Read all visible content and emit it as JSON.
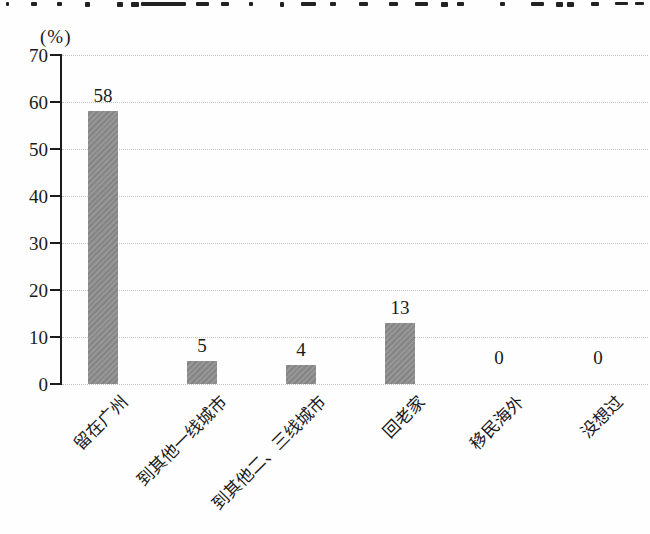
{
  "chart_data": {
    "type": "bar",
    "title": "",
    "ylabel": "(%)",
    "xlabel": "",
    "categories": [
      "留在广州",
      "到其他一线城市",
      "到其他二、三线城市",
      "回老家",
      "移民海外",
      "没想过"
    ],
    "values": [
      58,
      5,
      4,
      13,
      0,
      0
    ],
    "data_labels": [
      "58",
      "5",
      "4",
      "13",
      "0",
      "0"
    ],
    "ylim": [
      0,
      70
    ],
    "yticks": [
      0,
      10,
      20,
      30,
      40,
      50,
      60,
      70
    ],
    "grid": "horizontal-dotted",
    "legend": "none",
    "bar_color": "#8c8c8c",
    "gridline_color": "#c6c6c6",
    "axis_color": "#1b1b1b"
  },
  "top_clipped_marks": [
    {
      "x": 6,
      "w": 3,
      "h": 4
    },
    {
      "x": 31,
      "w": 6,
      "h": 4
    },
    {
      "x": 57,
      "w": 5,
      "h": 4
    },
    {
      "x": 85,
      "w": 5,
      "h": 5
    },
    {
      "x": 117,
      "w": 6,
      "h": 5
    },
    {
      "x": 131,
      "w": 8,
      "h": 5
    },
    {
      "x": 141,
      "w": 45,
      "h": 4
    },
    {
      "x": 196,
      "w": 13,
      "h": 4
    },
    {
      "x": 221,
      "w": 8,
      "h": 4
    },
    {
      "x": 249,
      "w": 4,
      "h": 4
    },
    {
      "x": 280,
      "w": 4,
      "h": 5
    },
    {
      "x": 301,
      "w": 15,
      "h": 4
    },
    {
      "x": 330,
      "w": 6,
      "h": 4
    },
    {
      "x": 359,
      "w": 9,
      "h": 4
    },
    {
      "x": 389,
      "w": 9,
      "h": 4
    },
    {
      "x": 415,
      "w": 13,
      "h": 4
    },
    {
      "x": 441,
      "w": 7,
      "h": 5
    },
    {
      "x": 457,
      "w": 7,
      "h": 4
    },
    {
      "x": 500,
      "w": 5,
      "h": 4
    },
    {
      "x": 531,
      "w": 13,
      "h": 4
    },
    {
      "x": 556,
      "w": 7,
      "h": 5
    },
    {
      "x": 567,
      "w": 7,
      "h": 5
    },
    {
      "x": 591,
      "w": 8,
      "h": 4
    },
    {
      "x": 615,
      "w": 13,
      "h": 3
    },
    {
      "x": 635,
      "w": 9,
      "h": 3
    }
  ]
}
